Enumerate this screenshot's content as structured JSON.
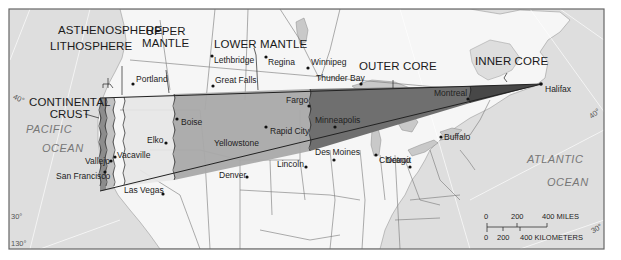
{
  "figure": {
    "type": "earth-layers-cross-section-map"
  },
  "layers": [
    {
      "id": "continental_crust",
      "label": "CONTINENTAL\nCRUST",
      "line1": "CONTINENTAL",
      "line2": "CRUST",
      "fill": "#8e8e8e"
    },
    {
      "id": "lithosphere",
      "label": "LITHOSPHERE",
      "fill": "#b4b4b4"
    },
    {
      "id": "asthenosphere",
      "label": "ASTHENOSPHERE",
      "fill": "#d2d2d2"
    },
    {
      "id": "upper_mantle",
      "label": "UPPER\nMANTLE",
      "line1": "UPPER",
      "line2": "MANTLE",
      "fill": "#e3e3e3"
    },
    {
      "id": "lower_mantle",
      "label": "LOWER MANTLE",
      "fill": "#a8a8a8"
    },
    {
      "id": "outer_core",
      "label": "OUTER CORE",
      "fill": "#6e6e6e"
    },
    {
      "id": "inner_core",
      "label": "INNER CORE",
      "fill": "#4a4a4a"
    }
  ],
  "cities": [
    {
      "name": "Portland",
      "x": 133,
      "y": 84
    },
    {
      "name": "Lethbridge",
      "x": 212,
      "y": 56
    },
    {
      "name": "Regina",
      "x": 266,
      "y": 57
    },
    {
      "name": "Winnipeg",
      "x": 308,
      "y": 68
    },
    {
      "name": "Great Falls",
      "x": 213,
      "y": 85
    },
    {
      "name": "Thunder Bay",
      "x": 361,
      "y": 84
    },
    {
      "name": "Fargo",
      "x": 309,
      "y": 106
    },
    {
      "name": "Minneapolis",
      "x": 335,
      "y": 127
    },
    {
      "name": "Montreal",
      "x": 468,
      "y": 99
    },
    {
      "name": "Halifax",
      "x": 541,
      "y": 84
    },
    {
      "name": "Boise",
      "x": 177,
      "y": 119
    },
    {
      "name": "Elko",
      "x": 166,
      "y": 143
    },
    {
      "name": "Yellowstone",
      "x": 0,
      "y": 0,
      "nodot": true
    },
    {
      "name": "Rapid City",
      "x": 266,
      "y": 127
    },
    {
      "name": "Vacaville",
      "x": 114,
      "y": 156
    },
    {
      "name": "Vallejo",
      "x": 111,
      "y": 160
    },
    {
      "name": "San Francisco",
      "x": 105,
      "y": 171
    },
    {
      "name": "Las Vegas",
      "x": 163,
      "y": 194
    },
    {
      "name": "Denver",
      "x": 247,
      "y": 177
    },
    {
      "name": "Lincoln",
      "x": 306,
      "y": 167
    },
    {
      "name": "Des Moines",
      "x": 334,
      "y": 160
    },
    {
      "name": "Chicago",
      "x": 376,
      "y": 155
    },
    {
      "name": "Detroit",
      "x": 410,
      "y": 167
    },
    {
      "name": "Buffalo",
      "x": 440,
      "y": 137
    }
  ],
  "oceans": [
    {
      "line1": "PACIFIC",
      "line2": "OCEAN"
    },
    {
      "line1": "ATLANTIC",
      "line2": "OCEAN"
    }
  ],
  "latitudes": {
    "left_40": "40°",
    "right_40": "40°",
    "left_30": "30°",
    "right_30": "30°",
    "lon_130": "130°"
  },
  "scale_bar": {
    "miles_ticks": [
      "0",
      "200",
      "400 MILES"
    ],
    "km_ticks": [
      "0",
      "200",
      "400 KILOMETERS"
    ]
  },
  "colors": {
    "ocean": "#dcdcdc",
    "land": "#f7f7f7",
    "lake": "#c8c8c8",
    "border": "#555555",
    "frame": "#6a6a6a"
  }
}
